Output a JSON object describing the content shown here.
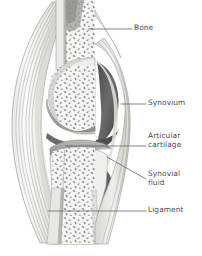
{
  "figure": {
    "background_color": "#ffffff",
    "width": 202,
    "height": 256
  },
  "labels": [
    {
      "id": "bone",
      "text": "Bone",
      "icon": "leader-line-icon",
      "points_to": "cancellous-bone-upper-shaft"
    },
    {
      "id": "synovium",
      "text": "Synovium",
      "icon": "leader-line-icon",
      "points_to": "synovial-membrane"
    },
    {
      "id": "articular-cartilage",
      "text": "Articular\ncartilage",
      "icon": "leader-line-icon",
      "points_to": "articular-cartilage-band"
    },
    {
      "id": "synovial-fluid",
      "text": "Synovial\nfluid",
      "icon": "leader-line-icon",
      "points_to": "synovial-cavity"
    },
    {
      "id": "ligament",
      "text": "Ligament",
      "icon": "leader-line-icon",
      "points_to": "ligament-fiber-bundle"
    }
  ],
  "colors": {
    "label_text": "#4a4a4a",
    "leader_line": "#5a5a5a",
    "bone_cortical": "#d7d7d2",
    "bone_marrow": "#f2f2ee",
    "trabecula": "#8c8c8c",
    "cartilage": "#a8a8a4",
    "synovial_cavity": "#5d5d5d",
    "synovium_membrane": "#c9c9c4",
    "ligament_fiber": "#9a9a96",
    "ligament_fill": "#e6e6e2",
    "outline": "#6e6e6e"
  },
  "structures": [
    {
      "name": "upper-bone-shaft",
      "description": "vertical femur shaft entering from top"
    },
    {
      "name": "lower-bone-shaft",
      "description": "vertical tibia shaft exiting at bottom, flared"
    },
    {
      "name": "cancellous-bone",
      "description": "speckled trabecular bone within epiphyses and shafts"
    },
    {
      "name": "femoral-condyle",
      "description": "rounded bone end above joint space"
    },
    {
      "name": "tibial-plateau",
      "description": "flat bone end below joint space"
    },
    {
      "name": "articular-cartilage-band",
      "description": "grey caps on both opposing bone surfaces"
    },
    {
      "name": "synovial-cavity",
      "description": "dark wedge-shaped joint space on the right"
    },
    {
      "name": "synovial-membrane",
      "description": "thin layered capsule lining the joint on the right"
    },
    {
      "name": "ligament-fiber-bundle",
      "description": "bowed parallel fibre bands on the left flank"
    }
  ]
}
